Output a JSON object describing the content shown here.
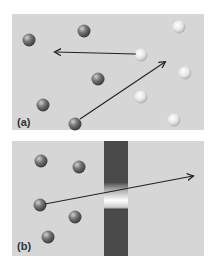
{
  "panels": [
    {
      "label": "(a)",
      "dark_particles": [
        [
          29,
          40
        ],
        [
          84,
          31
        ],
        [
          98,
          79
        ],
        [
          43,
          105
        ],
        [
          75,
          124
        ]
      ],
      "light_particles": [
        [
          179,
          27
        ],
        [
          141,
          55
        ],
        [
          185,
          73
        ],
        [
          141,
          97
        ],
        [
          174,
          120
        ]
      ],
      "arrows": [
        {
          "from": [
            136,
            54
          ],
          "to": [
            55,
            52
          ]
        },
        {
          "from": [
            80,
            119
          ],
          "to": [
            165,
            62
          ]
        }
      ]
    },
    {
      "label": "(b)",
      "particles": [
        [
          41,
          161
        ],
        [
          79,
          167
        ],
        [
          40,
          205
        ],
        [
          75,
          217
        ],
        [
          48,
          237
        ]
      ],
      "barrier": {
        "x": 104,
        "y": 141,
        "width": 24,
        "height": 115,
        "opening_top": 183,
        "opening_bottom": 210
      },
      "arrows": [
        {
          "from": [
            45,
            204
          ],
          "to": [
            193,
            176
          ]
        }
      ]
    }
  ],
  "colors": {
    "background": "#d6d6d6",
    "dark_particle": "#6a6a6a",
    "light_particle": "#e8e8e8",
    "barrier": "#4a4a4a",
    "arrow": "#222222"
  }
}
